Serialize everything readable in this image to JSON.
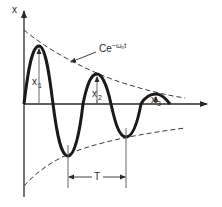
{
  "diagram": {
    "axes": {
      "y_label": "x",
      "x_label": ""
    },
    "envelope": {
      "label_base": "Ce",
      "label_exp_prefix": "−ω",
      "label_exp_sub": "n",
      "label_exp_suffix": "t"
    },
    "amplitudes": [
      {
        "name": "x",
        "sub": "1"
      },
      {
        "name": "x",
        "sub": "2"
      },
      {
        "name": "x",
        "sub": "3"
      }
    ],
    "period": {
      "label": "T"
    },
    "colors": {
      "curve": "#1a1a1a",
      "envelope": "#3a3a3a",
      "axes": "#2a2a2a",
      "background": "#ffffff"
    }
  }
}
